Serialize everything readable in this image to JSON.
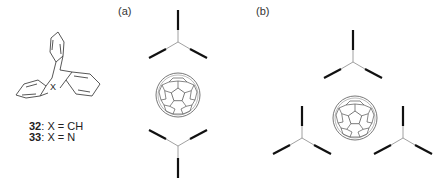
{
  "figure": {
    "compounds": [
      {
        "number": "32",
        "sep": ": ",
        "formula": "X = CH"
      },
      {
        "number": "33",
        "sep": ": ",
        "formula": "X = N"
      }
    ],
    "structure_atom_label": "X",
    "panels": [
      {
        "label": "(a)",
        "arrangement": "two triptycene units sandwiching C60 (top and bottom)"
      },
      {
        "label": "(b)",
        "arrangement": "three triptycene units surrounding C60 in trigonal arrangement"
      }
    ],
    "colors": {
      "lines": "#222222",
      "thin_lines": "#666666",
      "text": "#222222",
      "background": "#ffffff"
    }
  }
}
